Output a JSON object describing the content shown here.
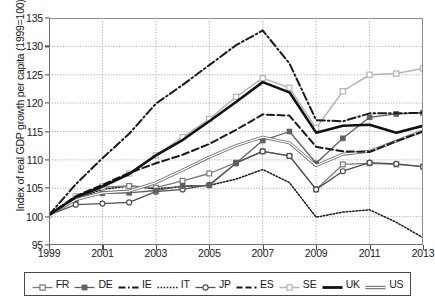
{
  "chart_data": {
    "type": "line",
    "title": "",
    "xlabel": "",
    "ylabel": "Index of real GDP growth per capita (1999=100)",
    "xlim": [
      1999,
      2013
    ],
    "ylim": [
      95,
      135
    ],
    "ytick_labels": [
      "95",
      "100",
      "105",
      "110",
      "115",
      "120",
      "125",
      "130",
      "135"
    ],
    "ytick_values": [
      95,
      100,
      105,
      110,
      115,
      120,
      125,
      130,
      135
    ],
    "xtick_labels": [
      "1999",
      "2001",
      "2003",
      "2005",
      "2007",
      "2009",
      "2011",
      "2013"
    ],
    "xtick_values": [
      1999,
      2001,
      2003,
      2005,
      2007,
      2009,
      2011,
      2013
    ],
    "x": [
      1999,
      2000,
      2001,
      2002,
      2003,
      2004,
      2005,
      2006,
      2007,
      2008,
      2009,
      2010,
      2011,
      2012,
      2013
    ],
    "grid": true,
    "legend_position": "bottom",
    "series": [
      {
        "name": "FR",
        "style": "line-open-square",
        "color": "#7a7a7a",
        "values": [
          100.3,
          103.1,
          105.2,
          105.4,
          105.1,
          106.3,
          107.6,
          109.5,
          111.5,
          110.7,
          104.8,
          109.2,
          109.4,
          109.2,
          108.8
        ]
      },
      {
        "name": "DE",
        "style": "line-filled-square",
        "color": "#606060",
        "values": [
          100.3,
          102.9,
          104.1,
          104.2,
          104.6,
          105.4,
          105.5,
          109.4,
          113.4,
          115.0,
          109.4,
          113.8,
          117.5,
          118.1,
          118.3
        ]
      },
      {
        "name": "IE",
        "style": "dash-dot",
        "color": "#1a1a1a",
        "values": [
          100.3,
          105.7,
          110.3,
          114.6,
          119.9,
          123.2,
          126.7,
          130.2,
          132.8,
          127.0,
          117.0,
          116.8,
          118.2,
          118.2,
          118.3
        ]
      },
      {
        "name": "IT",
        "style": "dotted",
        "color": "#1a1a1a",
        "values": [
          100.3,
          103.2,
          104.8,
          105.4,
          104.9,
          105.3,
          105.5,
          106.6,
          108.3,
          106.0,
          99.9,
          100.8,
          101.2,
          99.0,
          96.3
        ]
      },
      {
        "name": "JP",
        "style": "line-open-circle",
        "color": "#4f4f4f",
        "values": [
          100.3,
          102.1,
          102.3,
          102.5,
          104.4,
          104.8,
          105.6,
          109.4,
          111.5,
          110.7,
          104.8,
          108.0,
          109.5,
          109.3,
          108.8
        ]
      },
      {
        "name": "ES",
        "style": "dashed",
        "color": "#1a1a1a",
        "values": [
          100.3,
          103.6,
          105.6,
          107.7,
          109.4,
          110.9,
          112.8,
          115.3,
          118.0,
          117.8,
          112.3,
          111.5,
          111.4,
          113.3,
          115.0
        ]
      },
      {
        "name": "SE",
        "style": "light-open-square",
        "color": "#b5b5b5",
        "values": [
          100.3,
          103.6,
          105.3,
          107.6,
          110.8,
          114.0,
          117.2,
          121.1,
          124.4,
          122.7,
          115.6,
          122.1,
          125.0,
          125.2,
          126.1
        ]
      },
      {
        "name": "UK",
        "style": "thick-solid",
        "color": "#111111",
        "values": [
          100.3,
          103.4,
          105.3,
          107.5,
          110.8,
          113.5,
          116.8,
          120.2,
          123.7,
          121.9,
          114.8,
          116.0,
          116.2,
          114.8,
          116.0
        ]
      },
      {
        "name": "US",
        "style": "thick-grey-double",
        "color": "#7d7d7d",
        "values": [
          100.3,
          103.0,
          104.2,
          104.5,
          106.0,
          108.2,
          110.5,
          112.5,
          114.0,
          113.0,
          109.0,
          111.0,
          111.5,
          113.3,
          115.1
        ]
      }
    ]
  },
  "legend": {
    "items": [
      {
        "label": "FR"
      },
      {
        "label": "DE"
      },
      {
        "label": "IE"
      },
      {
        "label": "IT"
      },
      {
        "label": "JP"
      },
      {
        "label": "ES"
      },
      {
        "label": "SE"
      },
      {
        "label": "UK"
      },
      {
        "label": "US"
      }
    ]
  }
}
